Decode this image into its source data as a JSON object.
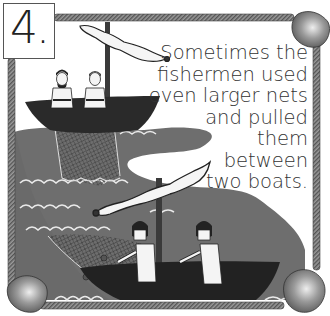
{
  "page": {
    "number": "4.",
    "caption_lines": [
      "Sometimes the",
      "fishermen used",
      "even larger nets",
      "and pulled",
      "them",
      "between",
      "two boats."
    ]
  },
  "illustration": {
    "subject": "fishermen pulling large nets between two boats",
    "palette": {
      "water": "#6e6e6e",
      "boat": "#2a2a2a",
      "frame_rope": "#7a7a7a",
      "corner_float": "#9a9a9a",
      "background": "#ffffff"
    }
  }
}
